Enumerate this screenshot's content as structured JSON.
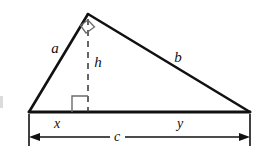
{
  "figure": {
    "background_color": "#ffffff",
    "stroke_color": "#111111",
    "marker_color": "#666666",
    "labels": {
      "side_a": "a",
      "side_b": "b",
      "altitude_h": "h",
      "segment_x": "x",
      "segment_y": "y",
      "base_c": "c"
    }
  },
  "geometry": {
    "apex": {
      "x": 88,
      "y": 14
    },
    "left_vertex": {
      "x": 29,
      "y": 112
    },
    "right_vertex": {
      "x": 250,
      "y": 112
    },
    "altitude_foot": {
      "x": 88,
      "y": 112
    },
    "dimension_line_y": 137,
    "extension_tick_bottom_y": 146
  },
  "label_positions": {
    "side_a": {
      "x": 55,
      "y": 48
    },
    "altitude_h": {
      "x": 98,
      "y": 62
    },
    "side_b": {
      "x": 178,
      "y": 57
    },
    "segment_x": {
      "x": 57,
      "y": 124
    },
    "segment_y": {
      "x": 180,
      "y": 124
    },
    "base_c": {
      "x": 117,
      "y": 137
    }
  },
  "markers": {
    "apex_right_angle": "right-angle-square",
    "foot_right_angle": "right-angle-square"
  }
}
